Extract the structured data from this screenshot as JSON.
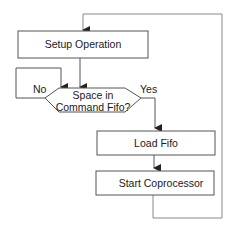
{
  "diagram": {
    "type": "flowchart",
    "nodes": [
      {
        "id": "setup",
        "shape": "process",
        "label": "Setup Operation"
      },
      {
        "id": "decision",
        "shape": "decision",
        "label_line1": "Space in",
        "label_line2": "Command Fifo?"
      },
      {
        "id": "load",
        "shape": "process",
        "label": "Load Fifo"
      },
      {
        "id": "start",
        "shape": "process",
        "label": "Start Coprocessor"
      }
    ],
    "edges": [
      {
        "from": "setup",
        "to": "decision",
        "label": ""
      },
      {
        "from": "decision",
        "to": "decision",
        "label": "No"
      },
      {
        "from": "decision",
        "to": "load",
        "label": "Yes"
      },
      {
        "from": "load",
        "to": "start",
        "label": ""
      },
      {
        "from": "start",
        "to": "setup",
        "label": ""
      }
    ],
    "labels": {
      "no": "No",
      "yes": "Yes"
    },
    "colors": {
      "stroke": "#555555",
      "loop_stroke": "#888888",
      "fill": "#ffffff",
      "text": "#1a1a1a"
    }
  }
}
